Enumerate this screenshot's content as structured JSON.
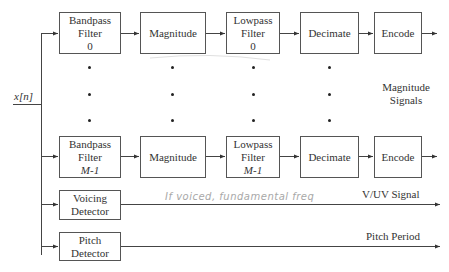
{
  "input_label": "x[n]",
  "channels": [
    {
      "id": "0",
      "blocks": [
        {
          "name": "bandpass-filter-0",
          "lines": [
            "Bandpass",
            "Filter",
            "0"
          ]
        },
        {
          "name": "magnitude-0",
          "lines": [
            "Magnitude"
          ]
        },
        {
          "name": "lowpass-filter-0",
          "lines": [
            "Lowpass",
            "Filter",
            "0"
          ]
        },
        {
          "name": "decimate-0",
          "lines": [
            "Decimate"
          ]
        },
        {
          "name": "encode-0",
          "lines": [
            "Encode"
          ]
        }
      ]
    },
    {
      "id": "M-1",
      "blocks": [
        {
          "name": "bandpass-filter-m-1",
          "lines": [
            "Bandpass",
            "Filter",
            "M-1"
          ]
        },
        {
          "name": "magnitude-m-1",
          "lines": [
            "Magnitude"
          ]
        },
        {
          "name": "lowpass-filter-m-1",
          "lines": [
            "Lowpass",
            "Filter",
            "M-1"
          ]
        },
        {
          "name": "decimate-m-1",
          "lines": [
            "Decimate"
          ]
        },
        {
          "name": "encode-m-1",
          "lines": [
            "Encode"
          ]
        }
      ]
    }
  ],
  "magnitude_signals_label": [
    "Magnitude",
    "Signals"
  ],
  "voicing_detector": {
    "lines": [
      "Voicing",
      "Detector"
    ],
    "output_label": "V/UV Signal"
  },
  "pitch_detector": {
    "lines": [
      "Pitch",
      "Detector"
    ],
    "output_label": "Pitch Period"
  },
  "handwritten_note": "If voiced, fundamental freq"
}
